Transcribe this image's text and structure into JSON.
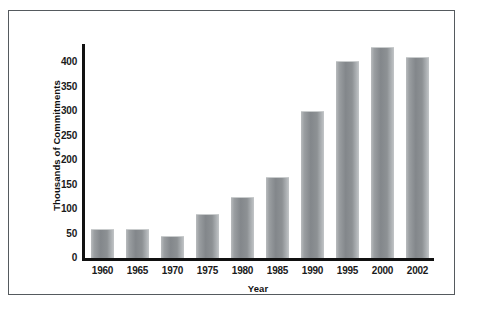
{
  "chart_data": {
    "type": "bar",
    "title": "",
    "subtitle": "",
    "xlabel": "Year",
    "ylabel": "Thousands of Commitments",
    "categories": [
      "1960",
      "1965",
      "1970",
      "1975",
      "1980",
      "1985",
      "1990",
      "1995",
      "2000",
      "2002"
    ],
    "values": [
      57,
      57,
      43,
      88,
      122,
      164,
      297,
      400,
      428,
      409
    ],
    "series": [
      {
        "name": "Commitments",
        "values": [
          57,
          57,
          43,
          88,
          122,
          164,
          297,
          400,
          428,
          409
        ]
      }
    ],
    "ylim": [
      0,
      440
    ],
    "yticks": [
      0,
      50,
      100,
      150,
      200,
      250,
      300,
      350,
      400
    ],
    "ytick_labels": [
      "0",
      "50",
      "100",
      "150",
      "200",
      "250",
      "300",
      "350",
      "400"
    ],
    "grid": false,
    "legend": false,
    "legend_position": "none",
    "bar_color": "#8d9194",
    "axis_color": "#111111",
    "frame_color": "#555a5e",
    "background_color": "#ffffff"
  }
}
